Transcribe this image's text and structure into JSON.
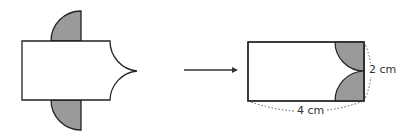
{
  "diagram": {
    "left_figure": {
      "shape": "rectangle with two shaded quarter circles and concave right edge"
    },
    "arrow": {
      "direction": "right"
    },
    "right_figure": {
      "shape": "rectangle with shaded region on right",
      "labels": {
        "width": "4 cm",
        "height": "2 cm"
      }
    },
    "colors": {
      "shade": "#9a9a9a",
      "stroke": "#222222",
      "dotted": "#555555"
    }
  }
}
